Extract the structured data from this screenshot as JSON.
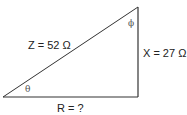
{
  "diagram": {
    "type": "impedance-triangle",
    "colors": {
      "line": "#333333",
      "text": "#222222",
      "angle_label": "#555555",
      "background": "#ffffff"
    },
    "vertices": {
      "bottom_left": [
        3,
        97
      ],
      "bottom_right": [
        138,
        97
      ],
      "top_right": [
        138,
        7
      ]
    },
    "labels": {
      "hypotenuse": "Z = 52 Ω",
      "vertical_side": "X = 27 Ω",
      "base": "R = ?",
      "angle_bottom_left": "θ",
      "angle_top": "ϕ"
    },
    "values": {
      "Z": {
        "symbol": "Z",
        "value": 52,
        "unit": "Ω"
      },
      "X": {
        "symbol": "X",
        "value": 27,
        "unit": "Ω"
      },
      "R": {
        "symbol": "R",
        "value": "?",
        "unit": ""
      }
    }
  }
}
